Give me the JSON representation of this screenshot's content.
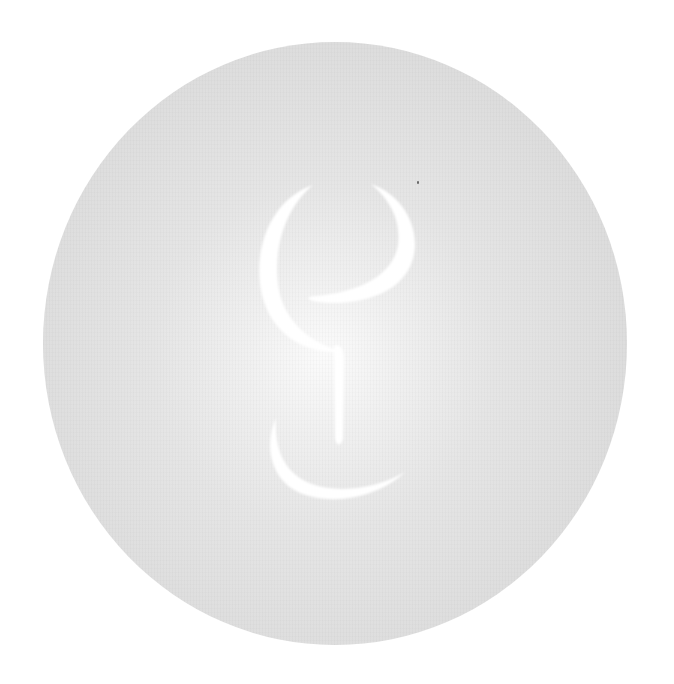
{
  "image": {
    "description": "Textured light-gray disc with soft white central glow and a white crescent-based emblem",
    "colors": {
      "background": "#ffffff",
      "disc_edge": "#d9d9d9",
      "disc_center_glow": "#fbfbfb",
      "emblem": "#ffffff",
      "speck": "#6a6a6a"
    },
    "emblem": {
      "parts": [
        "left-large-crescent",
        "upper-right-crescent",
        "vertical-stem",
        "lower-crescent"
      ]
    }
  }
}
